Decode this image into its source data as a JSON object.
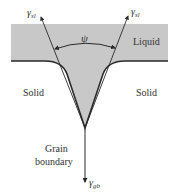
{
  "diagram": {
    "regions": {
      "liquid": "Liquid",
      "solid_left": "Solid",
      "solid_right": "Solid",
      "grain_boundary_line1": "Grain",
      "grain_boundary_line2": "boundary"
    },
    "vectors": {
      "left_tension": {
        "symbol": "γ",
        "subscript": "sl"
      },
      "right_tension": {
        "symbol": "γ",
        "subscript": "sl"
      },
      "grain_boundary_tension": {
        "symbol": "γ",
        "subscript": "gb"
      }
    },
    "angle_label": "ψ",
    "colors": {
      "liquid_fill": "#c8c8c8",
      "outline": "#2a2a2a",
      "background": "#ffffff"
    }
  }
}
